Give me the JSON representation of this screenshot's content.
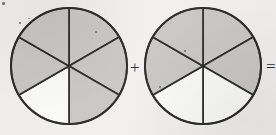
{
  "figure": {
    "background_color": "#f1f0ee",
    "stroke_color": "#2b2b2b",
    "shade_color": "#c9c8c6",
    "unshaded_color": "#fbfbfa",
    "operators": {
      "plus": "+",
      "equals": "="
    }
  },
  "chart_data": {
    "type": "pie",
    "xlabel": "",
    "ylabel": "",
    "legend": [],
    "charts": [
      {
        "name": "circle-1",
        "label": "First circle",
        "center_x": 69,
        "center_y": 66,
        "radius": 58,
        "total_sectors": 6,
        "shaded_sectors": 5,
        "unshaded_sectors": 1,
        "fraction": "5/6",
        "categories": [
          "top-right",
          "right",
          "bottom-right",
          "bottom-left",
          "left",
          "top-left"
        ],
        "values": [
          1,
          1,
          1,
          1,
          1,
          1
        ],
        "shaded": [
          true,
          true,
          true,
          false,
          true,
          true
        ],
        "start_angle_deg": -90,
        "sector_span_deg": 60
      },
      {
        "name": "circle-2",
        "label": "Second circle",
        "center_x": 203,
        "center_y": 66,
        "radius": 58,
        "total_sectors": 6,
        "shaded_sectors": 4,
        "unshaded_sectors": 2,
        "fraction": "4/6",
        "categories": [
          "top-right",
          "right",
          "bottom-right",
          "bottom-left",
          "left",
          "top-left"
        ],
        "values": [
          1,
          1,
          1,
          1,
          1,
          1
        ],
        "shaded": [
          true,
          true,
          false,
          false,
          true,
          true
        ],
        "start_angle_deg": -90,
        "sector_span_deg": 60
      }
    ]
  },
  "specks": [
    {
      "x": 2,
      "y": 2,
      "w": 3,
      "h": 3
    },
    {
      "x": 19,
      "y": 22,
      "w": 2,
      "h": 2
    },
    {
      "x": 28,
      "y": 18,
      "w": 2,
      "h": 1
    },
    {
      "x": 95,
      "y": 31,
      "w": 2,
      "h": 2
    },
    {
      "x": 67,
      "y": 67,
      "w": 2,
      "h": 2
    },
    {
      "x": 56,
      "y": 121,
      "w": 2,
      "h": 1
    },
    {
      "x": 159,
      "y": 86,
      "w": 2,
      "h": 2
    },
    {
      "x": 184,
      "y": 50,
      "w": 2,
      "h": 2
    }
  ]
}
